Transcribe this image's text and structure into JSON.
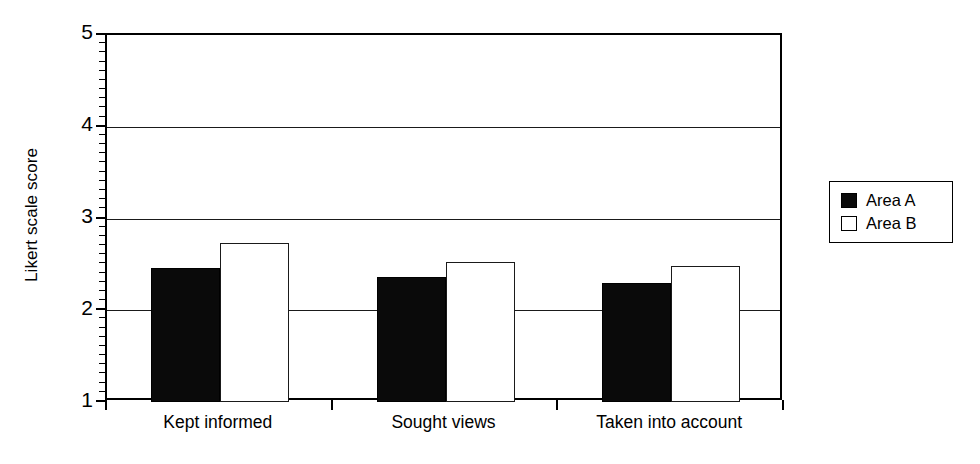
{
  "chart_data": {
    "type": "bar",
    "title": "",
    "subtitle": "",
    "xlabel": "",
    "ylabel": "Likert scale score",
    "categories": [
      "Kept informed",
      "Sought views",
      "Taken into account"
    ],
    "series": [
      {
        "name": "Area A",
        "color": "#000000",
        "fill": "solid",
        "values": [
          2.46,
          2.36,
          2.3
        ]
      },
      {
        "name": "Area B",
        "color": "#ffffff",
        "fill": "outline",
        "values": [
          2.73,
          2.53,
          2.48
        ]
      }
    ],
    "ylim": [
      1,
      5
    ],
    "y_major_ticks": [
      1,
      2,
      3,
      4,
      5
    ],
    "y_tick_labels": [
      "1",
      "2",
      "3",
      "4",
      "5"
    ],
    "y_minor_tick_step": 0.1,
    "grid": "horizontal-major",
    "legend_position": "right-outside",
    "legend_entries": [
      "Area A",
      "Area B"
    ],
    "annotations": []
  },
  "axis": {
    "y_title": "Likert scale score"
  }
}
